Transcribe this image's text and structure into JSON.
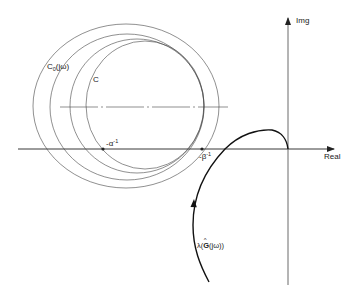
{
  "figure": {
    "type": "complex-plane-diagram",
    "axes": {
      "horizontal_label": "Real",
      "vertical_label": "Img"
    },
    "circles": [
      {
        "name": "outer-circle",
        "cx": 126,
        "cy": 106,
        "rx": 93,
        "ry": 82
      },
      {
        "name": "second-circle",
        "cx": 127,
        "cy": 107,
        "rx": 77,
        "ry": 73
      },
      {
        "name": "third-circle",
        "cx": 137,
        "cy": 106,
        "rx": 67,
        "ry": 67
      },
      {
        "name": "inner-circle-c",
        "cx": 145,
        "cy": 105,
        "rx": 59,
        "ry": 64
      }
    ],
    "labels": {
      "c0": {
        "main": "C",
        "sub": "0",
        "rest": "(jω)"
      },
      "c": "C",
      "alpha": {
        "main": "-α",
        "sup": "-1"
      },
      "beta": {
        "main": "-β",
        "sup": "-1"
      },
      "lambda": {
        "prefix": "λ(",
        "hat": "G",
        "suffix": "(jω))"
      }
    },
    "points": {
      "alpha_point": {
        "x": 103,
        "y": 149
      },
      "beta_point": {
        "x": 202,
        "y": 149
      }
    },
    "colors": {
      "ink": "#222222",
      "thin_line": "#444444",
      "background": "#ffffff"
    }
  }
}
